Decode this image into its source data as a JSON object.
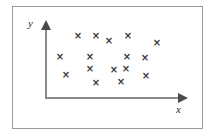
{
  "figure": {
    "type": "scatter-diagram",
    "background_color": "#ffffff",
    "frame_color": "#999999",
    "axis_color": "#8a8a8a",
    "marker_color": "#3a3a3a",
    "label_color": "#2b2b2b"
  },
  "axes": {
    "y_label": "y",
    "x_label": "x",
    "y_axis_name": "vertical-axis",
    "x_axis_name": "horizontal-axis",
    "arrow_up_icon": "arrow-up-icon",
    "arrow_right_icon": "arrow-right-icon"
  },
  "chart_data": {
    "type": "scatter",
    "title": "",
    "xlabel": "x",
    "ylabel": "y",
    "grid": false,
    "legend": null,
    "marker": "x",
    "marker_glyph": "×",
    "xlim": [
      0,
      10
    ],
    "ylim": [
      0,
      10
    ],
    "tick_labels": {
      "x": [],
      "y": []
    },
    "points_px": [
      {
        "x": 78,
        "y": 36
      },
      {
        "x": 96,
        "y": 36
      },
      {
        "x": 109,
        "y": 41
      },
      {
        "x": 128,
        "y": 36
      },
      {
        "x": 157,
        "y": 43
      },
      {
        "x": 60,
        "y": 57
      },
      {
        "x": 90,
        "y": 57
      },
      {
        "x": 127,
        "y": 57
      },
      {
        "x": 145,
        "y": 58
      },
      {
        "x": 90,
        "y": 69
      },
      {
        "x": 66,
        "y": 75
      },
      {
        "x": 114,
        "y": 70
      },
      {
        "x": 126,
        "y": 69
      },
      {
        "x": 146,
        "y": 76
      },
      {
        "x": 96,
        "y": 83
      },
      {
        "x": 121,
        "y": 82
      }
    ],
    "points": [
      {
        "x": 2.5,
        "y": 8.7
      },
      {
        "x": 3.8,
        "y": 8.7
      },
      {
        "x": 4.7,
        "y": 8.0
      },
      {
        "x": 6.1,
        "y": 8.7
      },
      {
        "x": 8.2,
        "y": 7.6
      },
      {
        "x": 1.1,
        "y": 5.8
      },
      {
        "x": 3.3,
        "y": 5.8
      },
      {
        "x": 6.0,
        "y": 5.8
      },
      {
        "x": 7.3,
        "y": 5.7
      },
      {
        "x": 3.3,
        "y": 4.1
      },
      {
        "x": 1.5,
        "y": 3.3
      },
      {
        "x": 5.0,
        "y": 4.0
      },
      {
        "x": 5.9,
        "y": 4.1
      },
      {
        "x": 7.4,
        "y": 3.1
      },
      {
        "x": 3.7,
        "y": 2.1
      },
      {
        "x": 5.5,
        "y": 2.2
      }
    ],
    "point_count": 16
  }
}
